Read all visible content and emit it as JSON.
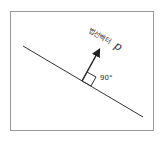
{
  "diagram": {
    "vector_label": "법선벡터",
    "vector_symbol": "p",
    "angle_label": "90°",
    "colors": {
      "line": "#333333",
      "frame": "#9a9a9a"
    }
  }
}
